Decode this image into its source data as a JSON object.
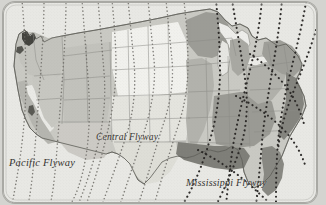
{
  "figure": {
    "kind": "map",
    "rendering": "grayscale scanned halftone print",
    "frame": {
      "style": "rounded rectangle border",
      "border_color": "#a9a9a4",
      "background_color": "#e4e4e0",
      "corner_radius_px": 12
    },
    "canvas": {
      "width": 326,
      "height": 205
    }
  },
  "labels": {
    "pacific": "Pacific Flyway",
    "central": "Central Flyway",
    "mississippi": "Mississippi Flyway"
  },
  "colors": {
    "paper": "#e4e4e0",
    "frame_border": "#a9a9a4",
    "ocean": "#e8e8e4",
    "land_light": "#f1f1ed",
    "land_pale": "#e0e0db",
    "land_mid": "#c9c9c3",
    "land_medium": "#b6b6b0",
    "land_dark": "#9a9a94",
    "land_darkest": "#7e7e78",
    "water_dark": "#4a4a46",
    "state_border": "#8c8c86",
    "coast_line": "#6e6e68",
    "route_dark": "#2c2a28",
    "route_mid": "#6b6964",
    "label_text": "#35332f"
  },
  "regions": [
    {
      "name": "pacific-northwest",
      "tone": "land_mid"
    },
    {
      "name": "california-coast-range",
      "tone": "land_medium"
    },
    {
      "name": "california-central-valley",
      "tone": "land_light"
    },
    {
      "name": "great-basin",
      "tone": "land_mid"
    },
    {
      "name": "rocky-mountains",
      "tone": "land_mid"
    },
    {
      "name": "northern-great-plains",
      "tone": "land_light"
    },
    {
      "name": "southern-great-plains",
      "tone": "land_pale"
    },
    {
      "name": "texas",
      "tone": "land_pale"
    },
    {
      "name": "upper-midwest",
      "tone": "land_dark"
    },
    {
      "name": "great-lakes-water",
      "tone": "land_light"
    },
    {
      "name": "mississippi-valley",
      "tone": "land_medium"
    },
    {
      "name": "gulf-coast",
      "tone": "land_darkest"
    },
    {
      "name": "southeast",
      "tone": "land_dark"
    },
    {
      "name": "appalachians",
      "tone": "land_medium"
    },
    {
      "name": "northeast",
      "tone": "land_dark"
    },
    {
      "name": "atlantic-coastal-plain",
      "tone": "land_darkest"
    },
    {
      "name": "puget-sound",
      "tone": "water_dark"
    }
  ],
  "migration_routes": {
    "dark_dotted_count": 9,
    "light_dotted_count": 10,
    "dot_style": "round dotted line",
    "description": "dotted flight-path lines running north-south and converging toward the Gulf and Atlantic coasts"
  }
}
